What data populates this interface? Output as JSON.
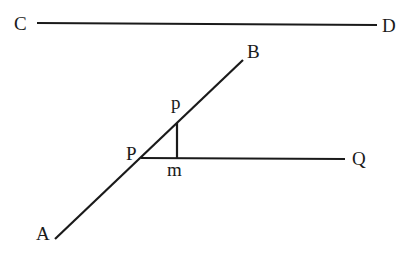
{
  "diagram": {
    "lines": [
      {
        "id": "CD",
        "from": "C",
        "to": "D",
        "x1": 37,
        "y1": 23,
        "x2": 377,
        "y2": 25
      },
      {
        "id": "AB",
        "from": "A",
        "to": "B",
        "x1": 55,
        "y1": 239,
        "x2": 243,
        "y2": 60
      },
      {
        "id": "PQ",
        "from": "P",
        "to": "Q",
        "x1": 141,
        "y1": 158,
        "x2": 345,
        "y2": 159
      },
      {
        "id": "pm",
        "from": "p",
        "to": "m",
        "x1": 177,
        "y1": 123,
        "x2": 177,
        "y2": 158
      }
    ],
    "labels": {
      "C": "C",
      "D": "D",
      "B": "B",
      "p": "p",
      "P": "P",
      "m": "m",
      "Q": "Q",
      "A": "A"
    },
    "stroke_color": "#1a1a1a",
    "background": "#ffffff"
  }
}
